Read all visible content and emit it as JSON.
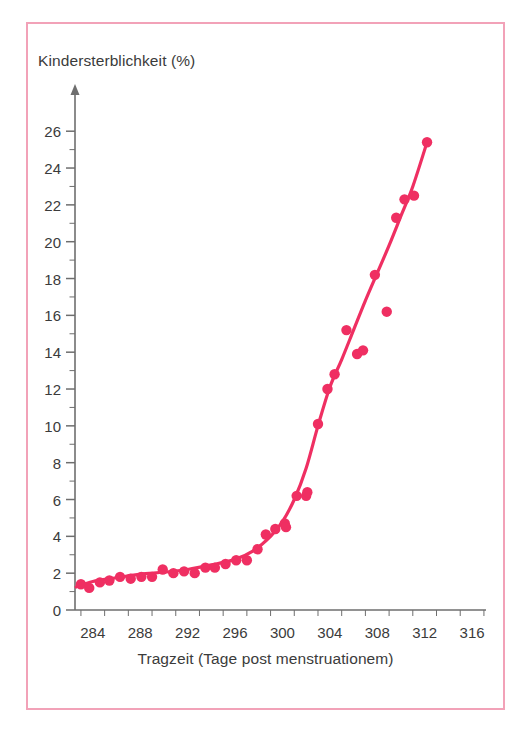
{
  "figure": {
    "border_color": "#f2a2b8",
    "background": "#ffffff"
  },
  "chart_data": {
    "type": "scatter",
    "title": "",
    "xlabel": "Tragzeit (Tage post menstruationem)",
    "ylabel": "Kindersterblichkeit (%)",
    "series_color": "#ef2f62",
    "grid": false,
    "legend": null,
    "xlim": [
      282.5,
      316.5
    ],
    "ylim": [
      0,
      26.5
    ],
    "xticks": [
      284,
      288,
      292,
      296,
      300,
      304,
      308,
      312,
      316
    ],
    "xtick_labels": [
      "284",
      "288",
      "292",
      "296",
      "300",
      "304",
      "308",
      "312",
      "316"
    ],
    "xtick_minor_step": 2,
    "yticks": [
      0,
      2,
      4,
      6,
      8,
      10,
      12,
      14,
      16,
      18,
      20,
      22,
      24,
      26
    ],
    "ytick_labels": [
      "0",
      "2",
      "4",
      "6",
      "8",
      "10",
      "12",
      "14",
      "16",
      "18",
      "20",
      "22",
      "24",
      "26"
    ],
    "ytick_minor_step": 1,
    "points": [
      {
        "x": 283.0,
        "y": 1.4
      },
      {
        "x": 283.7,
        "y": 1.2
      },
      {
        "x": 284.6,
        "y": 1.5
      },
      {
        "x": 285.4,
        "y": 1.6
      },
      {
        "x": 286.3,
        "y": 1.8
      },
      {
        "x": 287.2,
        "y": 1.7
      },
      {
        "x": 288.1,
        "y": 1.8
      },
      {
        "x": 289.0,
        "y": 1.8
      },
      {
        "x": 289.9,
        "y": 2.2
      },
      {
        "x": 290.8,
        "y": 2.0
      },
      {
        "x": 291.7,
        "y": 2.1
      },
      {
        "x": 292.6,
        "y": 2.0
      },
      {
        "x": 293.5,
        "y": 2.3
      },
      {
        "x": 294.3,
        "y": 2.3
      },
      {
        "x": 295.2,
        "y": 2.5
      },
      {
        "x": 296.1,
        "y": 2.7
      },
      {
        "x": 297.0,
        "y": 2.7
      },
      {
        "x": 297.9,
        "y": 3.3
      },
      {
        "x": 298.6,
        "y": 4.1
      },
      {
        "x": 299.4,
        "y": 4.4
      },
      {
        "x": 300.2,
        "y": 4.7
      },
      {
        "x": 300.3,
        "y": 4.5
      },
      {
        "x": 301.2,
        "y": 6.2
      },
      {
        "x": 302.0,
        "y": 6.2
      },
      {
        "x": 302.1,
        "y": 6.4
      },
      {
        "x": 303.0,
        "y": 10.1
      },
      {
        "x": 303.8,
        "y": 12.0
      },
      {
        "x": 304.4,
        "y": 12.8
      },
      {
        "x": 305.4,
        "y": 15.2
      },
      {
        "x": 306.3,
        "y": 13.9
      },
      {
        "x": 306.8,
        "y": 14.1
      },
      {
        "x": 307.8,
        "y": 18.2
      },
      {
        "x": 308.8,
        "y": 16.2
      },
      {
        "x": 309.6,
        "y": 21.3
      },
      {
        "x": 310.3,
        "y": 22.3
      },
      {
        "x": 311.1,
        "y": 22.5
      },
      {
        "x": 312.2,
        "y": 25.4
      }
    ],
    "fit_curve": [
      {
        "x": 282.6,
        "y": 1.25
      },
      {
        "x": 284.0,
        "y": 1.55
      },
      {
        "x": 286.0,
        "y": 1.75
      },
      {
        "x": 288.0,
        "y": 1.95
      },
      {
        "x": 290.0,
        "y": 2.05
      },
      {
        "x": 292.0,
        "y": 2.2
      },
      {
        "x": 294.0,
        "y": 2.45
      },
      {
        "x": 296.0,
        "y": 2.75
      },
      {
        "x": 297.5,
        "y": 3.2
      },
      {
        "x": 299.0,
        "y": 4.0
      },
      {
        "x": 300.0,
        "y": 4.8
      },
      {
        "x": 301.0,
        "y": 6.0
      },
      {
        "x": 302.0,
        "y": 7.7
      },
      {
        "x": 303.0,
        "y": 10.0
      },
      {
        "x": 304.0,
        "y": 12.1
      },
      {
        "x": 305.0,
        "y": 13.6
      },
      {
        "x": 306.0,
        "y": 15.2
      },
      {
        "x": 307.0,
        "y": 16.8
      },
      {
        "x": 308.0,
        "y": 18.3
      },
      {
        "x": 309.0,
        "y": 19.8
      },
      {
        "x": 310.0,
        "y": 21.4
      },
      {
        "x": 311.0,
        "y": 23.0
      },
      {
        "x": 312.2,
        "y": 25.4
      }
    ]
  }
}
